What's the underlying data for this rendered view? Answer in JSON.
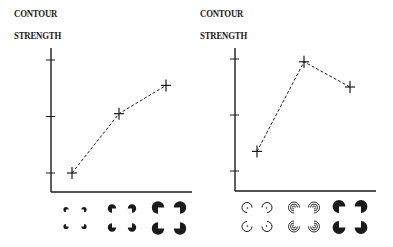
{
  "chart_data": [
    {
      "type": "line",
      "title": "",
      "ylabel": "CONTOUR STRENGTH",
      "ylabel_lines": [
        "CONTOUR",
        "STRENGTH"
      ],
      "xlabel": "",
      "categories": [
        "small-pacmen-inducers",
        "medium-pacmen-inducers",
        "large-pacmen-inducers"
      ],
      "category_icons": [
        "pacman-small",
        "pacman-medium",
        "pacman-large"
      ],
      "y_ticks": [
        1,
        2,
        3
      ],
      "y_tick_labels": [
        "",
        "",
        ""
      ],
      "ylim": [
        0.65,
        3.2
      ],
      "values": [
        1.0,
        2.05,
        2.55
      ],
      "line_style": "dashed",
      "marker": "plus",
      "grid": false,
      "legend": "none"
    },
    {
      "type": "line",
      "title": "",
      "ylabel": "CONTOUR STRENGTH",
      "ylabel_lines": [
        "CONTOUR",
        "STRENGTH"
      ],
      "xlabel": "",
      "categories": [
        "outline-arc-inducers",
        "concentric-arc-inducers",
        "solid-pacmen-inducers"
      ],
      "category_icons": [
        "arc-single",
        "arc-concentric",
        "pacman-solid"
      ],
      "y_ticks": [
        1,
        2,
        3
      ],
      "y_tick_labels": [
        "",
        "",
        ""
      ],
      "ylim": [
        0.65,
        3.2
      ],
      "values": [
        1.35,
        2.95,
        2.5
      ],
      "line_style": "dashed",
      "marker": "plus",
      "grid": false,
      "legend": "none"
    }
  ],
  "colors": {
    "ink": "#1a1a1a",
    "background": "#ffffff"
  }
}
